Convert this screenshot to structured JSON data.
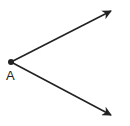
{
  "diagram": {
    "type": "angle",
    "vertex": {
      "label": "A",
      "x": 11,
      "y": 62
    },
    "rays": [
      {
        "name": "upper-ray",
        "from": [
          11,
          62
        ],
        "to": [
          111,
          11
        ]
      },
      {
        "name": "lower-ray",
        "from": [
          11,
          62
        ],
        "to": [
          111,
          115
        ]
      }
    ],
    "colors": {
      "stroke": "#222222",
      "background": "#ffffff"
    }
  }
}
